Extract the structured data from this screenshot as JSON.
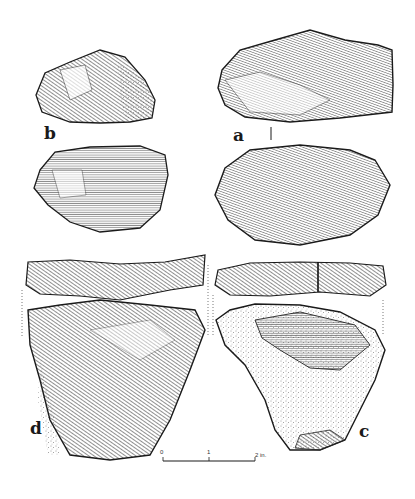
{
  "figure": {
    "labels": {
      "a": "a",
      "b": "b",
      "c": "c",
      "d": "d"
    },
    "scale_bar": {
      "start": "0",
      "mid": "1",
      "end": "2 in."
    },
    "artifacts": [
      {
        "id": "a",
        "views": [
          "face",
          "reverse"
        ]
      },
      {
        "id": "b",
        "views": [
          "face",
          "reverse"
        ]
      },
      {
        "id": "c",
        "views": [
          "edge",
          "face"
        ]
      },
      {
        "id": "d",
        "views": [
          "edge",
          "face"
        ]
      }
    ],
    "colors": {
      "ink": "#1a1a1a",
      "paper": "#ffffff",
      "hatch": "#555555"
    }
  }
}
